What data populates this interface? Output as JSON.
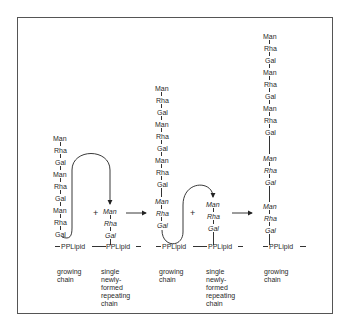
{
  "diagram": {
    "columns": [
      {
        "chain": [
          "Man",
          "Rha",
          "Gal",
          "Man",
          "Rha",
          "Gal",
          "Man",
          "Rha",
          "Gal"
        ],
        "italic_units": [],
        "anchor": "PPLipid",
        "label": "growing\nchain"
      },
      {
        "chain": [
          "Man",
          "Rha",
          "Gal"
        ],
        "italic_units": [
          0,
          1,
          2
        ],
        "anchor": "PPLipid",
        "label": "single\nnewly-\nformed\nrepeating\nchain"
      },
      {
        "chain": [
          "Man",
          "Rha",
          "Gal",
          "Man",
          "Rha",
          "Gal",
          "Man",
          "Rha",
          "Gal",
          "Man",
          "Rha",
          "Gal"
        ],
        "italic_units": [
          9,
          10,
          11
        ],
        "anchor": "PPLipid",
        "label": "growing\nchain"
      },
      {
        "chain": [
          "Man",
          "Rha",
          "Gal"
        ],
        "italic_units": [
          0,
          1,
          2
        ],
        "anchor": "PPLipid",
        "label": "single\nnewly-\nformed\nrepeating\nchain"
      },
      {
        "chain": [
          "Man",
          "Rha",
          "Gal",
          "Man",
          "Rha",
          "Gal",
          "Man",
          "Rha",
          "Gal",
          "Man",
          "Rha",
          "Gal",
          "Man",
          "Rha",
          "Gal"
        ],
        "italic_units": [
          9,
          10,
          11,
          12,
          13,
          14
        ],
        "anchor": "PPLipid",
        "label": "growing\nchain"
      }
    ],
    "operators": [
      "+",
      "+"
    ],
    "arrows": [
      "reaction-arrow-1",
      "reaction-arrow-2"
    ]
  },
  "text": {
    "c1": [
      "Man",
      "Rha",
      "Gal",
      "Man",
      "Rha",
      "Gal",
      "Man",
      "Rha",
      "Gal"
    ],
    "c2": [
      "Man",
      "Rha",
      "Gal"
    ],
    "c3": [
      "Man",
      "Rha",
      "Gal",
      "Man",
      "Rha",
      "Gal",
      "Man",
      "Rha",
      "Gal",
      "Man",
      "Rha",
      "Gal"
    ],
    "c4": [
      "Man",
      "Rha",
      "Gal"
    ],
    "c5": [
      "Man",
      "Rha",
      "Gal",
      "Man",
      "Rha",
      "Gal",
      "Man",
      "Rha",
      "Gal",
      "Man",
      "Rha",
      "Gal",
      "Man",
      "Rha",
      "Gal"
    ],
    "pplipid": "PPLipid",
    "plus": "+",
    "growing": "growing\nchain",
    "single": "single\nnewly-\nformed\nrepeating\nchain"
  }
}
